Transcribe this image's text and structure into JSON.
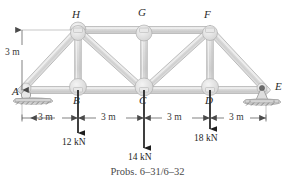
{
  "figure": {
    "caption": "Probs. 6–31/6–32"
  },
  "colors": {
    "member_fill": "#d8d8d8",
    "member_edge": "#9a9a9a",
    "gusset_fill": "#e2e2e2",
    "gusset_edge": "#a8a8a8",
    "support_fill": "#d0d0d0",
    "support_edge": "#8f8f8f",
    "load_arrow": "#1d1d1d",
    "dimension_line": "#4a4a4a",
    "text": "#2b2b2b"
  },
  "joints": [
    {
      "name": "A",
      "label": "A",
      "x": 22,
      "y": 90,
      "label_x": 12,
      "label_y": 92,
      "support": "roller"
    },
    {
      "name": "B",
      "label": "B",
      "x": 78,
      "y": 90,
      "label_x": 73,
      "label_y": 101,
      "support": "none"
    },
    {
      "name": "C",
      "label": "C",
      "x": 144,
      "y": 90,
      "label_x": 139,
      "label_y": 101,
      "support": "none"
    },
    {
      "name": "D",
      "label": "D",
      "x": 210,
      "y": 90,
      "label_x": 205,
      "label_y": 101,
      "support": "none"
    },
    {
      "name": "E",
      "label": "E",
      "x": 266,
      "y": 90,
      "label_x": 274,
      "label_y": 86,
      "support": "pin"
    },
    {
      "name": "H",
      "label": "H",
      "x": 78,
      "y": 30,
      "label_x": 72,
      "label_y": 9,
      "support": "none"
    },
    {
      "name": "G",
      "label": "G",
      "x": 144,
      "y": 30,
      "label_x": 138,
      "label_y": 7,
      "support": "none"
    },
    {
      "name": "F",
      "label": "F",
      "x": 210,
      "y": 30,
      "label_x": 204,
      "label_y": 9,
      "support": "none"
    }
  ],
  "members": [
    {
      "name": "A-B",
      "from": "A",
      "to": "B",
      "type": "bottom-chord"
    },
    {
      "name": "B-C",
      "from": "B",
      "to": "C",
      "type": "bottom-chord"
    },
    {
      "name": "C-D",
      "from": "C",
      "to": "D",
      "type": "bottom-chord"
    },
    {
      "name": "D-E",
      "from": "D",
      "to": "E",
      "type": "bottom-chord"
    },
    {
      "name": "H-G",
      "from": "H",
      "to": "G",
      "type": "top-chord"
    },
    {
      "name": "G-F",
      "from": "G",
      "to": "F",
      "type": "top-chord"
    },
    {
      "name": "A-H",
      "from": "A",
      "to": "H",
      "type": "end-diagonal"
    },
    {
      "name": "F-E",
      "from": "F",
      "to": "E",
      "type": "end-diagonal"
    },
    {
      "name": "B-H",
      "from": "B",
      "to": "H",
      "type": "vertical"
    },
    {
      "name": "C-G",
      "from": "C",
      "to": "G",
      "type": "vertical"
    },
    {
      "name": "D-F",
      "from": "D",
      "to": "F",
      "type": "vertical"
    },
    {
      "name": "H-C",
      "from": "H",
      "to": "C",
      "type": "diagonal"
    },
    {
      "name": "C-F",
      "from": "C",
      "to": "F",
      "type": "diagonal"
    }
  ],
  "loads": [
    {
      "name": "load-at-B",
      "joint": "B",
      "value": "12 kN",
      "x": 78,
      "y": 90,
      "tip_y": 133,
      "label_x": 62,
      "label_y": 140
    },
    {
      "name": "load-at-C",
      "joint": "C",
      "value": "14 kN",
      "x": 144,
      "y": 90,
      "tip_y": 148,
      "label_x": 128,
      "label_y": 154
    },
    {
      "name": "load-at-D",
      "joint": "D",
      "value": "18 kN",
      "x": 210,
      "y": 90,
      "tip_y": 129,
      "label_x": 194,
      "label_y": 136
    }
  ],
  "dimensions": {
    "vertical": {
      "name": "height-dimension",
      "value": "3 m",
      "label_x": 6,
      "label_y": 52,
      "x": 22,
      "y_top": 30,
      "y_bottom": 90
    },
    "horizontal_line_y": 118,
    "horizontal": [
      {
        "name": "span-A-B",
        "value": "3 m",
        "x_start": 22,
        "x_end": 78,
        "label_x": 38,
        "label_y": 113
      },
      {
        "name": "span-B-C",
        "value": "3 m",
        "x_start": 78,
        "x_end": 144,
        "label_x": 101,
        "label_y": 113
      },
      {
        "name": "span-C-D",
        "value": "3 m",
        "x_start": 144,
        "x_end": 210,
        "label_x": 167,
        "label_y": 113
      },
      {
        "name": "span-D-E",
        "value": "3 m",
        "x_start": 210,
        "x_end": 266,
        "label_x": 227,
        "label_y": 113
      }
    ]
  }
}
